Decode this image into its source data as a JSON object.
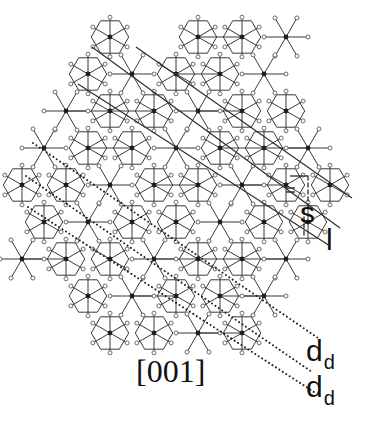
{
  "figure": {
    "zone_axis_label": "[001]",
    "labels": {
      "s": "s",
      "l": "l",
      "dd_main": "d",
      "dd_sub": "d"
    },
    "colors": {
      "bond": "#3a3a3a",
      "atom_hub": "#1e1e1e",
      "atom_satellite": "#6a6a6a",
      "line": "#2a2a2a",
      "dotted": "#222222",
      "background": "#ffffff"
    },
    "lattice": {
      "hub_spacing_x": 66,
      "hub_spacing_y": 38,
      "spoke_length": 22,
      "origin": [
        25,
        37
      ]
    },
    "solid_lines": [
      {
        "from": [
          92,
          47
        ],
        "to": [
          340,
          228
        ]
      },
      {
        "from": [
          78,
          84
        ],
        "to": [
          330,
          246
        ]
      },
      {
        "from": [
          136,
          47
        ],
        "to": [
          352,
          198
        ]
      }
    ],
    "dotted_lines": [
      {
        "from": [
          33,
          143
        ],
        "to": [
          318,
          338
        ]
      },
      {
        "from": [
          26,
          176
        ],
        "to": [
          312,
          372
        ]
      },
      {
        "from": [
          28,
          207
        ],
        "to": [
          314,
          392
        ]
      }
    ],
    "annotation_marks": {
      "s_bracket": {
        "x": [
          290,
          308
        ],
        "y": [
          176,
          208
        ]
      },
      "equals_mark": {
        "x": 286,
        "y": 188
      }
    }
  }
}
